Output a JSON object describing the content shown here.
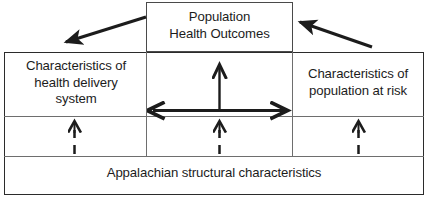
{
  "figure": {
    "type": "conceptual-framework-diagram",
    "title_box": {
      "label": "Population\nHealth Outcomes"
    },
    "left_box": {
      "label": "Characteristics of\nhealth delivery\nsystem"
    },
    "right_box": {
      "label": "Characteristics of\npopulation at risk"
    },
    "bottom_box": {
      "label": "Appalachian structural characteristics"
    },
    "connectors": [
      {
        "name": "outcomes-to-health-system-arrow",
        "style": "solid",
        "heads": "single",
        "direction": "down-left",
        "from": "Population Health Outcomes",
        "to": "Characteristics of health delivery system"
      },
      {
        "name": "population-to-outcomes-arrow",
        "style": "solid",
        "heads": "single",
        "direction": "up-left",
        "from": "Characteristics of population at risk",
        "to": "Population Health Outcomes"
      },
      {
        "name": "center-vertical-up-arrow",
        "style": "solid",
        "heads": "single",
        "direction": "up",
        "to": "Population Health Outcomes"
      },
      {
        "name": "bidirectional-horizontal-arrow",
        "style": "solid",
        "heads": "double",
        "direction": "left-right",
        "between": [
          "Characteristics of health delivery system",
          "Characteristics of population at risk"
        ]
      },
      {
        "name": "structural-to-health-system-dashed-arrow",
        "style": "dashed",
        "heads": "single",
        "direction": "up"
      },
      {
        "name": "structural-to-center-dashed-arrow",
        "style": "dashed",
        "heads": "single",
        "direction": "up"
      },
      {
        "name": "structural-to-population-dashed-arrow",
        "style": "dashed",
        "heads": "single",
        "direction": "up"
      }
    ],
    "colors": {
      "background": "#ffffff",
      "stroke": "#1c1c1c",
      "frame": "#2b2b2b",
      "inner_rule": "#6e6e6e",
      "text": "#1c1c1c"
    }
  }
}
